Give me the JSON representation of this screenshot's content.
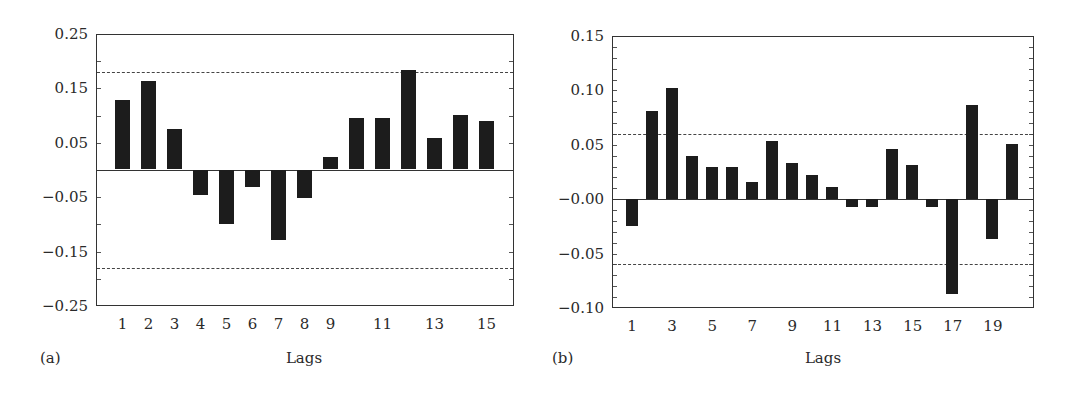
{
  "chart_data": [
    {
      "id": "a",
      "type": "bar",
      "panel_label": "(a)",
      "title": "",
      "xlabel": "Lags",
      "ylabel": "",
      "categories": [
        1,
        2,
        3,
        4,
        5,
        6,
        7,
        8,
        9,
        10,
        11,
        12,
        13,
        14,
        15
      ],
      "values": [
        0.128,
        0.162,
        0.075,
        -0.046,
        -0.101,
        -0.033,
        -0.13,
        -0.052,
        0.023,
        0.094,
        0.094,
        0.182,
        0.058,
        0.101,
        0.089
      ],
      "ylim": [
        -0.25,
        0.25
      ],
      "yticks": [
        "0.25",
        "0.15",
        "0.05",
        "-0.05",
        "-0.15",
        "-0.25"
      ],
      "ytick_values": [
        0.25,
        0.15,
        0.05,
        -0.05,
        -0.15,
        -0.25
      ],
      "minor_tick_step": 0.05,
      "xtick_labels": [
        "1",
        "2",
        "3",
        "4",
        "5",
        "6",
        "7",
        "8",
        "9",
        "",
        "11",
        "",
        "13",
        "",
        "15"
      ],
      "confidence_bounds": [
        0.18,
        -0.18
      ],
      "grid": false,
      "legend": null
    },
    {
      "id": "b",
      "type": "bar",
      "panel_label": "(b)",
      "title": "",
      "xlabel": "Lags",
      "ylabel": "",
      "categories": [
        1,
        2,
        3,
        4,
        5,
        6,
        7,
        8,
        9,
        10,
        11,
        12,
        13,
        14,
        15,
        16,
        17,
        18,
        19,
        20
      ],
      "values": [
        -0.025,
        0.081,
        0.102,
        0.039,
        0.029,
        0.029,
        0.015,
        0.053,
        0.033,
        0.022,
        0.011,
        -0.008,
        -0.008,
        0.046,
        0.031,
        -0.008,
        -0.088,
        0.086,
        -0.037,
        0.05
      ],
      "ylim": [
        -0.1,
        0.15
      ],
      "yticks": [
        "0.15",
        "0.10",
        "0.05",
        "-0.00",
        "-0.05",
        "-0.10"
      ],
      "ytick_values": [
        0.15,
        0.1,
        0.05,
        0.0,
        -0.05,
        -0.1
      ],
      "minor_tick_step": 0.01,
      "xtick_labels": [
        "1",
        "",
        "3",
        "",
        "5",
        "",
        "7",
        "",
        "9",
        "",
        "11",
        "",
        "13",
        "",
        "15",
        "",
        "17",
        "",
        "19",
        ""
      ],
      "confidence_bounds": [
        0.06,
        -0.06
      ],
      "grid": false,
      "legend": null
    }
  ],
  "style": {
    "bar_color": "#1c1c1c",
    "axis_color": "#333333",
    "background": "#ffffff"
  }
}
